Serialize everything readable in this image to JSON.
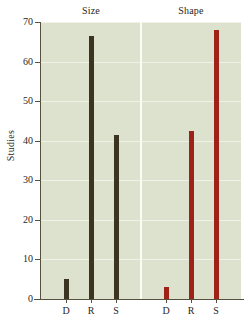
{
  "chart_data": {
    "type": "bar",
    "title": "",
    "xlabel": "",
    "ylabel": "Studies",
    "ylim": [
      0,
      70
    ],
    "yticks": [
      0,
      10,
      20,
      30,
      40,
      50,
      60,
      70
    ],
    "grid": true,
    "legend": "none",
    "groups": [
      {
        "name": "Size",
        "color": "#3a3420",
        "categories": [
          "D",
          "R",
          "S"
        ],
        "values": [
          5,
          66.5,
          41.5
        ]
      },
      {
        "name": "Shape",
        "color": "#9e2218",
        "categories": [
          "D",
          "R",
          "S"
        ],
        "values": [
          3,
          42.5,
          68
        ]
      }
    ],
    "categories": [
      "D",
      "R",
      "S",
      "D",
      "R",
      "S"
    ],
    "values": [
      5,
      66.5,
      41.5,
      3,
      42.5,
      68
    ],
    "colors": {
      "plot_background": "#dde2cf",
      "gridline": "#f2f4ea",
      "axis": "#55513f",
      "size_bars": "#3a3420",
      "shape_bars": "#9e2218",
      "text": "#2a261d",
      "page_background": "#ffffff"
    }
  }
}
